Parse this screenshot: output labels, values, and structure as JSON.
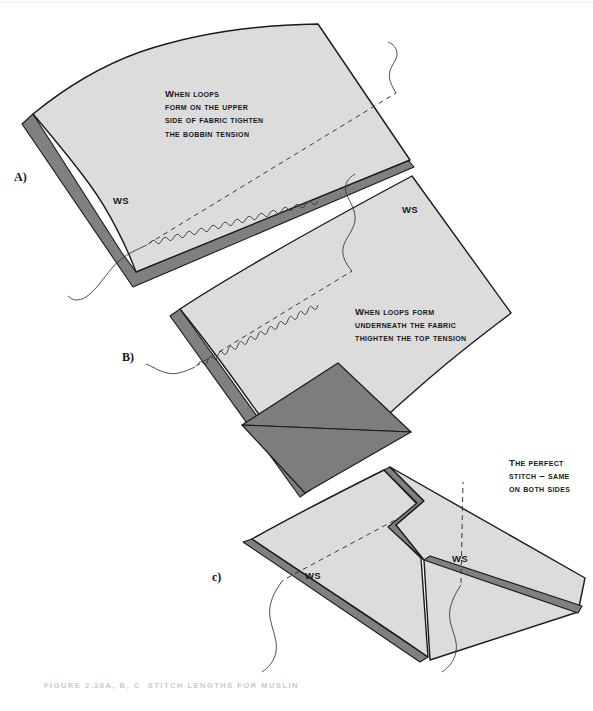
{
  "figure": {
    "caption": "FIGURE 2.26A, B, C  STITCH LENGTHS FOR MUSLIN",
    "background_color": "#ffffff",
    "fabric_light_color": "#dcdcdc",
    "fabric_edge_color": "#808080",
    "fabric_dark_color": "#7d7d7d",
    "outline_color": "#1a1a1a",
    "text_color": "#16181c",
    "caption_color": "#c9c9c9"
  },
  "panels": [
    {
      "letter": "A)",
      "callout": "When loops\nform on the upper\nside of fabric tighten\nthe bobbin tension",
      "ws_labels": [
        "WS"
      ]
    },
    {
      "letter": "B)",
      "callout": "When loops form\nunderneath the fabric\nthighten the top tension",
      "ws_labels": [
        "WS"
      ]
    },
    {
      "letter": "c)",
      "callout": "The perfect\nstitch – same\non both sides",
      "ws_labels": [
        "WS",
        "WS"
      ]
    }
  ]
}
